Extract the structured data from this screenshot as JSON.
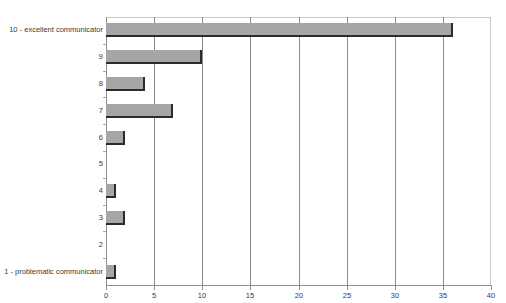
{
  "chart_data": {
    "type": "bar",
    "orientation": "horizontal",
    "title": "",
    "xlabel": "",
    "ylabel": "",
    "categories": [
      "10 - excellent communicator",
      "9",
      "8",
      "7",
      "6",
      "5",
      "4",
      "3",
      "2",
      "1 - problematic communicator"
    ],
    "values": [
      36,
      10,
      4,
      7,
      2,
      0,
      1,
      2,
      0,
      1
    ],
    "xlim": [
      0,
      40
    ],
    "xticks": [
      0,
      5,
      10,
      15,
      20,
      25,
      30,
      35,
      40
    ],
    "xticklabels": [
      "0",
      "5",
      "10",
      "15",
      "20",
      "25",
      "30",
      "35",
      "40"
    ],
    "grid": "vertical",
    "legend": "none",
    "bar_color": "#a6a6a6",
    "bar_edge_color": "#2b2b2b",
    "gridline_color": "#8a8a8a",
    "axis_color": "#909090",
    "background_color": "#ffffff"
  }
}
